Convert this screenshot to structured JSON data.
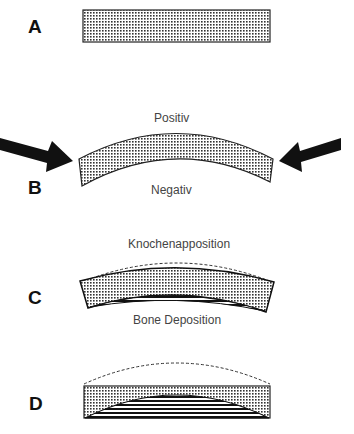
{
  "panels": [
    {
      "label": "A",
      "description": "straight bar"
    },
    {
      "label": "B",
      "description": "bent bar under compression",
      "top_caption": "Positiv",
      "bottom_caption": "Negativ"
    },
    {
      "label": "C",
      "description": "bent bar with deposition on concave side",
      "top_caption": "Knochenapposition",
      "bottom_caption": "Bone Deposition"
    },
    {
      "label": "D",
      "description": "straightened bar with deposited bone"
    }
  ],
  "colors": {
    "stroke": "#111111",
    "fill": "#bdbdbd",
    "caption": "#444444"
  }
}
